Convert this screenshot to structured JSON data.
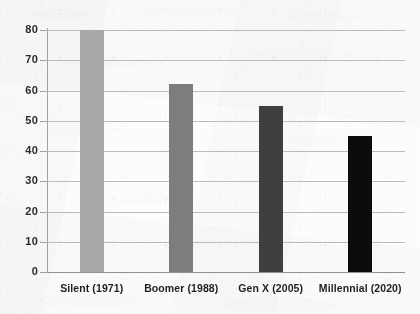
{
  "chart_data": {
    "type": "bar",
    "title": "",
    "subtitle": "",
    "xlabel": "",
    "ylabel": "",
    "categories": [
      "Silent (1971)",
      "Boomer (1988)",
      "Gen X (2005)",
      "Millennial (2020)"
    ],
    "values": [
      80,
      62,
      55,
      45
    ],
    "series": [
      {
        "name": "",
        "values": [
          80,
          62,
          55,
          45
        ]
      }
    ],
    "bar_colors": [
      "#a9a9a9",
      "#7d7d7d",
      "#3f3f3f",
      "#0c0c0c"
    ],
    "ylim": [
      0,
      80
    ],
    "yticks": [
      0,
      10,
      20,
      30,
      40,
      50,
      60,
      70,
      80
    ],
    "ytick_labels": [
      "0",
      "10",
      "20",
      "30",
      "40",
      "50",
      "60",
      "70",
      "80"
    ],
    "grid": true,
    "grid_axis": "y",
    "legend": false,
    "legend_position": "none",
    "annotations": []
  },
  "style": {
    "background_color": "#fdfdfc",
    "grid_color": "#b9bcbe",
    "axis_color": "#9fa2a4",
    "tick_label_color": "#2b2b2b",
    "category_label_color": "#1f1f1f"
  }
}
